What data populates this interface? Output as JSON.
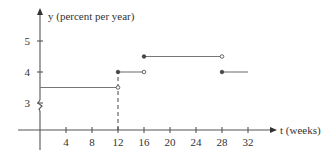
{
  "chart_data": {
    "type": "line",
    "subtype": "step",
    "title": "",
    "xlabel": "t (weeks)",
    "ylabel": "y (percent per year)",
    "xlim": [
      0,
      34
    ],
    "ylim": [
      2.5,
      5.5
    ],
    "x_ticks": [
      4,
      8,
      12,
      16,
      20,
      24,
      28,
      32
    ],
    "y_ticks": [
      3,
      4,
      5
    ],
    "y_axis_break": true,
    "grid": false,
    "legend": null,
    "segments": [
      {
        "x_start": 0,
        "x_end": 12,
        "y": 3.5,
        "start_closed": false,
        "end_closed": false
      },
      {
        "x_start": 12,
        "x_end": 16,
        "y": 4.0,
        "start_closed": true,
        "end_closed": false
      },
      {
        "x_start": 16,
        "x_end": 28,
        "y": 4.5,
        "start_closed": true,
        "end_closed": false
      },
      {
        "x_start": 28,
        "x_end": 32,
        "y": 4.0,
        "start_closed": true,
        "end_closed": false
      }
    ],
    "annotations": [
      {
        "type": "dashed-vertical",
        "x": 12,
        "y_from": 0,
        "y_to": 4.0
      }
    ]
  },
  "labels": {
    "y_axis": "y (percent per year)",
    "x_axis": "t (weeks)"
  }
}
